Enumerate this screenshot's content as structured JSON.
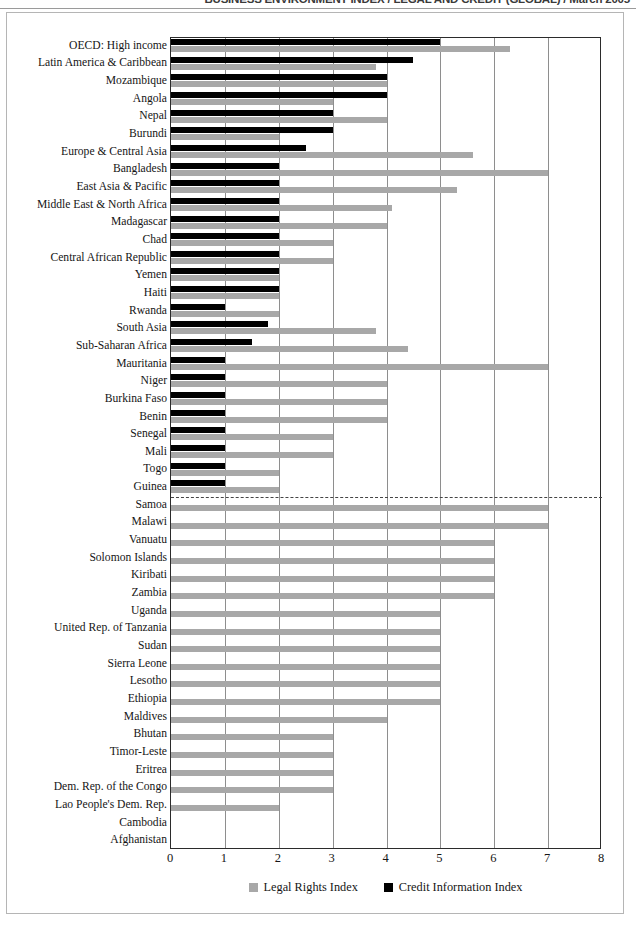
{
  "running_header": "BUSINESS ENVIRONMENT INDEX / LEGAL AND CREDIT (GLOBAL) / March 2005",
  "legend": {
    "legal_label": "Legal Rights Index",
    "credit_label": "Credit Information Index",
    "legal_color": "#a8a8a8",
    "credit_color": "#000000"
  },
  "axis": {
    "ticks": [
      "0",
      "1",
      "2",
      "3",
      "4",
      "5",
      "6",
      "7",
      "8"
    ],
    "min": 0,
    "max": 8
  },
  "chart_data": {
    "type": "bar",
    "orientation": "horizontal",
    "title": "",
    "xlabel": "",
    "ylabel": "",
    "xlim": [
      0,
      8
    ],
    "grid": true,
    "legend_position": "bottom",
    "annotations": [
      "dashed horizontal separator after Guinea (countries below have no Credit Information Index bar)"
    ],
    "categories": [
      "OECD: High income",
      "Latin America & Caribbean",
      "Mozambique",
      "Angola",
      "Nepal",
      "Burundi",
      "Europe & Central Asia",
      "Bangladesh",
      "East Asia & Pacific",
      "Middle East & North Africa",
      "Madagascar",
      "Chad",
      "Central African Republic",
      "Yemen",
      "Haiti",
      "Rwanda",
      "South Asia",
      "Sub-Saharan Africa",
      "Mauritania",
      "Niger",
      "Burkina Faso",
      "Benin",
      "Senegal",
      "Mali",
      "Togo",
      "Guinea",
      "Samoa",
      "Malawi",
      "Vanuatu",
      "Solomon Islands",
      "Kiribati",
      "Zambia",
      "Uganda",
      "United Rep. of Tanzania",
      "Sudan",
      "Sierra Leone",
      "Lesotho",
      "Ethiopia",
      "Maldives",
      "Bhutan",
      "Timor-Leste",
      "Eritrea",
      "Dem. Rep. of the Congo",
      "Lao People's Dem. Rep.",
      "Cambodia",
      "Afghanistan"
    ],
    "series": [
      {
        "name": "Credit Information Index",
        "color": "#000000",
        "values": [
          5.0,
          4.5,
          4.0,
          4.0,
          3.0,
          3.0,
          2.5,
          2.0,
          2.0,
          2.0,
          2.0,
          2.0,
          2.0,
          2.0,
          2.0,
          1.0,
          1.8,
          1.5,
          1.0,
          1.0,
          1.0,
          1.0,
          1.0,
          1.0,
          1.0,
          1.0,
          0,
          0,
          0,
          0,
          0,
          0,
          0,
          0,
          0,
          0,
          0,
          0,
          0,
          0,
          0,
          0,
          0,
          0,
          0,
          0
        ]
      },
      {
        "name": "Legal Rights Index",
        "color": "#a8a8a8",
        "values": [
          6.3,
          3.8,
          4.0,
          3.0,
          4.0,
          2.0,
          5.6,
          7.0,
          5.3,
          4.1,
          4.0,
          3.0,
          3.0,
          2.0,
          2.0,
          2.0,
          3.8,
          4.4,
          7.0,
          4.0,
          4.0,
          4.0,
          3.0,
          3.0,
          2.0,
          2.0,
          7.0,
          7.0,
          6.0,
          6.0,
          6.0,
          6.0,
          5.0,
          5.0,
          5.0,
          5.0,
          5.0,
          5.0,
          4.0,
          3.0,
          3.0,
          3.0,
          3.0,
          2.0,
          0,
          0
        ]
      }
    ]
  }
}
